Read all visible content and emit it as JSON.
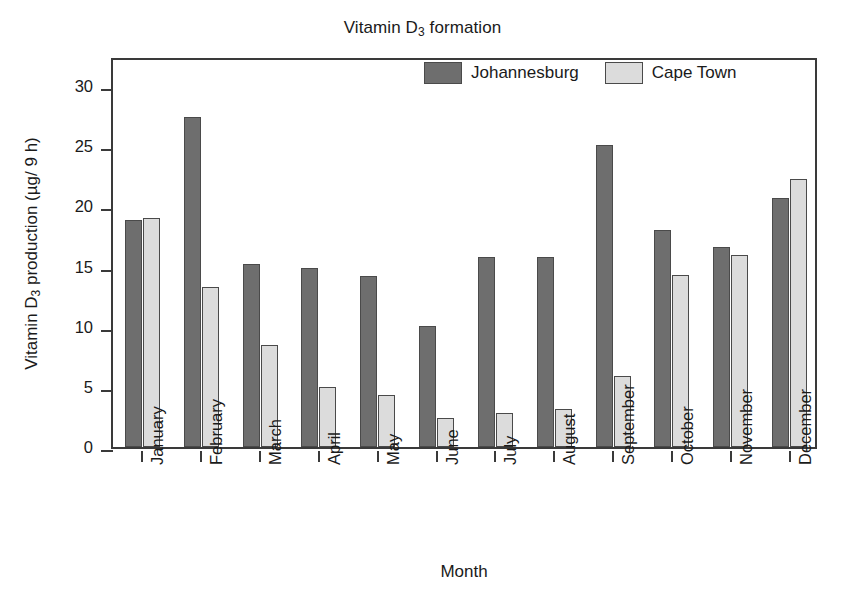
{
  "chart_data": {
    "type": "bar",
    "title": "Vitamin D3 formation",
    "title_parts": {
      "pre": "Vitamin D",
      "sub": "3",
      "post": " formation"
    },
    "xlabel": "Month",
    "ylabel": "Vitamin D3 production (µg/ 9 h)",
    "ylabel_parts": {
      "pre": "Vitamin D",
      "sub": "3",
      "post": " production (µg/ 9 h)"
    },
    "categories": [
      "January",
      "February",
      "March",
      "April",
      "May",
      "June",
      "July",
      "August",
      "September",
      "October",
      "November",
      "December"
    ],
    "series": [
      {
        "name": "Johannesburg",
        "color": "#6e6e6e",
        "values": [
          18.9,
          27.4,
          15.2,
          14.9,
          14.2,
          10.1,
          15.8,
          15.8,
          25.1,
          18.0,
          16.6,
          20.7
        ]
      },
      {
        "name": "Cape Town",
        "color": "#dcdcdc",
        "values": [
          19.0,
          13.3,
          8.5,
          5.0,
          4.3,
          2.4,
          2.8,
          3.2,
          5.9,
          14.3,
          16.0,
          22.3
        ]
      }
    ],
    "ylim": [
      0,
      32.5
    ],
    "yticks": [
      0,
      5,
      10,
      15,
      20,
      25,
      30
    ],
    "ytick_labels": [
      "0",
      "5",
      "10",
      "15",
      "20",
      "25",
      "30"
    ],
    "grid": false,
    "legend_position": "top-center",
    "axis_color": "#3a3a3a",
    "bar_edge_color": "#4a4a4a",
    "background": "#ffffff"
  }
}
